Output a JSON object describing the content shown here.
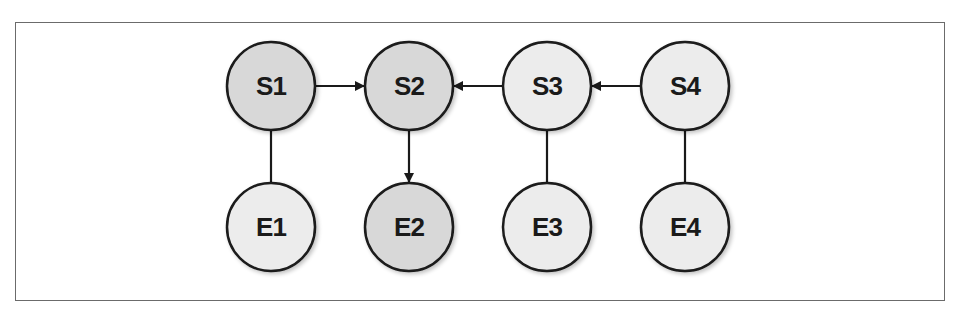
{
  "diagram": {
    "frame": {
      "border_color": "#6b6b6b"
    },
    "colors": {
      "shaded_fill": "#d8d8d8",
      "plain_fill": "#ececec",
      "stroke": "#1a1a1a"
    },
    "nodes": [
      {
        "id": "S1",
        "label": "S1",
        "x": 271,
        "y": 86,
        "shaded": true
      },
      {
        "id": "S2",
        "label": "S2",
        "x": 409,
        "y": 86,
        "shaded": true
      },
      {
        "id": "S3",
        "label": "S3",
        "x": 547,
        "y": 86,
        "shaded": false
      },
      {
        "id": "S4",
        "label": "S4",
        "x": 685,
        "y": 86,
        "shaded": false
      },
      {
        "id": "E1",
        "label": "E1",
        "x": 271,
        "y": 227,
        "shaded": false
      },
      {
        "id": "E2",
        "label": "E2",
        "x": 409,
        "y": 227,
        "shaded": true
      },
      {
        "id": "E3",
        "label": "E3",
        "x": 547,
        "y": 227,
        "shaded": false
      },
      {
        "id": "E4",
        "label": "E4",
        "x": 685,
        "y": 227,
        "shaded": false
      }
    ],
    "edges": [
      {
        "from": "S1",
        "to": "S2",
        "directed": true
      },
      {
        "from": "S3",
        "to": "S2",
        "directed": true
      },
      {
        "from": "S4",
        "to": "S3",
        "directed": true
      },
      {
        "from": "S2",
        "to": "E2",
        "directed": true
      },
      {
        "from": "S1",
        "to": "E1",
        "directed": false
      },
      {
        "from": "S3",
        "to": "E3",
        "directed": false
      },
      {
        "from": "S4",
        "to": "E4",
        "directed": false
      }
    ]
  }
}
